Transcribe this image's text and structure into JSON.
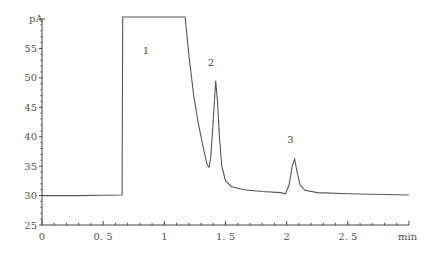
{
  "chart_data": {
    "type": "line",
    "title": "",
    "xlabel": "min",
    "ylabel": "pA",
    "xlim": [
      0,
      3
    ],
    "ylim": [
      25,
      60
    ],
    "grid": false,
    "legend": null,
    "x_ticks": [
      0,
      0.5,
      1,
      1.5,
      2,
      2.5
    ],
    "x_tick_labels": [
      "0",
      "0. 5",
      "1",
      "1. 5",
      "2",
      "2. 5"
    ],
    "y_ticks": [
      25,
      30,
      35,
      40,
      45,
      50,
      55
    ],
    "y_tick_labels": [
      "25",
      "30",
      "35",
      "40",
      "45",
      "50",
      "55"
    ],
    "series": [
      {
        "name": "chromatogram",
        "x": [
          0,
          0.3,
          0.5,
          0.655,
          0.66,
          1.17,
          1.2,
          1.24,
          1.28,
          1.32,
          1.35,
          1.365,
          1.38,
          1.4,
          1.42,
          1.435,
          1.45,
          1.47,
          1.5,
          1.55,
          1.65,
          1.8,
          1.95,
          1.99,
          2.02,
          2.045,
          2.065,
          2.085,
          2.11,
          2.15,
          2.25,
          2.5,
          3.0
        ],
        "y": [
          30.0,
          30.0,
          30.05,
          30.1,
          61,
          61,
          54,
          47,
          42,
          38,
          35.2,
          34.8,
          36.5,
          43,
          49.5,
          46,
          40,
          35,
          32.5,
          31.5,
          31.0,
          30.7,
          30.5,
          30.3,
          31.8,
          35.0,
          36.2,
          34.0,
          31.8,
          30.9,
          30.5,
          30.3,
          30.1
        ]
      }
    ],
    "annotations": [
      {
        "text": "1",
        "x": 0.85,
        "y": 54
      },
      {
        "text": "2",
        "x": 1.38,
        "y": 52
      },
      {
        "text": "3",
        "x": 2.03,
        "y": 39
      }
    ]
  }
}
